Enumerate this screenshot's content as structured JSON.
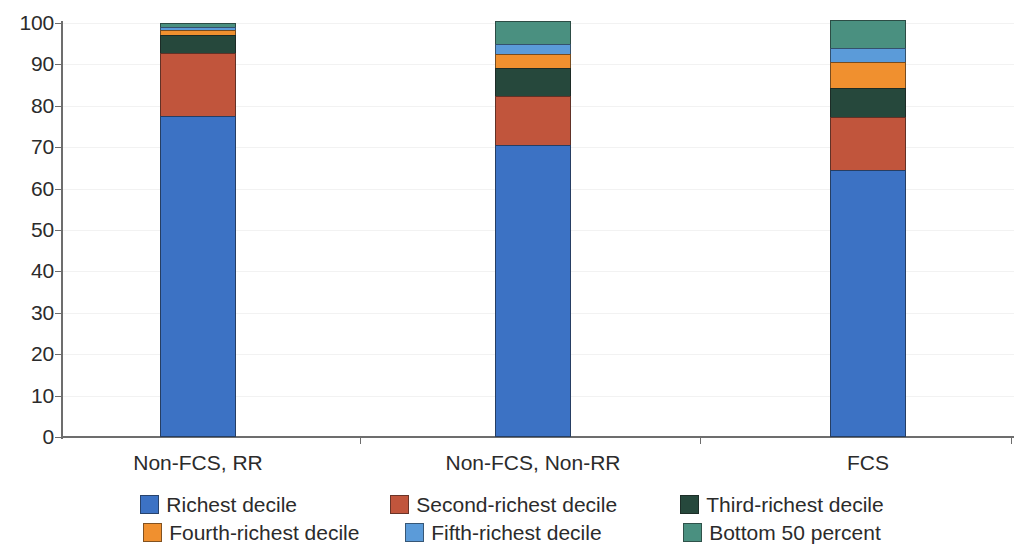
{
  "chart_data": {
    "type": "bar",
    "stacked": true,
    "title": "",
    "subtitle": "",
    "xlabel": "",
    "ylabel": "",
    "ylim": [
      0,
      100
    ],
    "ytick_labels": [
      "100",
      "90",
      "80",
      "70",
      "60",
      "50",
      "40",
      "30",
      "20",
      "10",
      "0"
    ],
    "yticks": [
      100,
      90,
      80,
      70,
      60,
      50,
      40,
      30,
      20,
      10,
      0
    ],
    "grid": true,
    "grid_axis": "y",
    "legend_position": "bottom",
    "categories": [
      "Non-FCS, RR",
      "Non-FCS, Non-RR",
      "FCS"
    ],
    "series": [
      {
        "name": "Richest decile",
        "color": "#3C72C4",
        "values": [
          77.5,
          70.5,
          64.5
        ]
      },
      {
        "name": "Second-richest decile",
        "color": "#C1553C",
        "values": [
          15.2,
          11.8,
          12.8
        ]
      },
      {
        "name": "Third-richest decile",
        "color": "#26483C",
        "values": [
          4.3,
          6.8,
          7.0
        ]
      },
      {
        "name": "Fourth-richest decile",
        "color": "#F0902F",
        "values": [
          1.2,
          3.4,
          6.3
        ]
      },
      {
        "name": "Fifth-richest decile",
        "color": "#5B9BD9",
        "values": [
          0.9,
          2.4,
          3.4
        ]
      },
      {
        "name": "Bottom 50 percent",
        "color": "#4A9080",
        "values": [
          0.9,
          5.6,
          6.8
        ]
      }
    ],
    "totals": [
      100.0,
      100.5,
      100.8
    ]
  },
  "axis": {
    "y_axis_color": "#6d6d6d",
    "x_axis_color": "#6d6d6d"
  },
  "legend": {
    "rows": [
      [
        "Richest decile",
        "Second-richest decile",
        "Third-richest decile"
      ],
      [
        "Fourth-richest decile",
        "Fifth-richest decile",
        "Bottom 50 percent"
      ]
    ]
  }
}
